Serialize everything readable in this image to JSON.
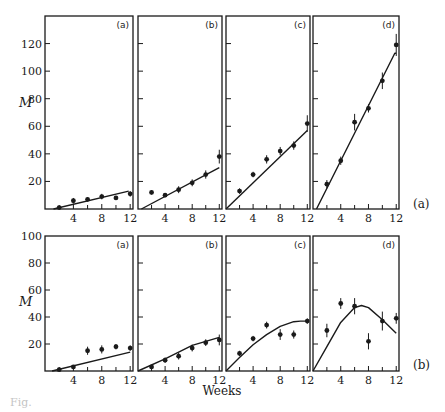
{
  "figure": {
    "xlabel": "Weeks",
    "ylabel": "M",
    "caption": "Fig."
  },
  "chart_data": [
    {
      "type": "scatter",
      "row": "(a)",
      "panel": "(a)",
      "xlabel": "Weeks",
      "ylabel": "M",
      "xlim": [
        0,
        12.4
      ],
      "ylim": [
        0,
        140
      ],
      "xticks": [
        4,
        8,
        12
      ],
      "yticks": [
        20,
        40,
        60,
        80,
        100,
        120
      ],
      "points": {
        "x": [
          2,
          4,
          6,
          8,
          10,
          12
        ],
        "y": [
          1,
          6,
          7,
          9,
          8,
          11
        ],
        "err": [
          1,
          2,
          1.5,
          2,
          1.5,
          2
        ]
      },
      "fit_line": {
        "x": [
          1.2,
          11.8
        ],
        "y": [
          0,
          13
        ]
      }
    },
    {
      "type": "scatter",
      "row": "(a)",
      "panel": "(b)",
      "xlim": [
        0,
        12.4
      ],
      "ylim": [
        0,
        140
      ],
      "xticks": [
        4,
        8,
        12
      ],
      "points": {
        "x": [
          2,
          4,
          6,
          8,
          10,
          12
        ],
        "y": [
          12,
          10,
          14,
          19,
          25,
          38
        ],
        "err": [
          1.5,
          1.5,
          2.5,
          2.5,
          3,
          5
        ]
      },
      "fit_line": {
        "x": [
          0.5,
          12
        ],
        "y": [
          0,
          30
        ]
      }
    },
    {
      "type": "scatter",
      "row": "(a)",
      "panel": "(c)",
      "xlim": [
        0,
        12.4
      ],
      "ylim": [
        0,
        140
      ],
      "xticks": [
        4,
        8,
        12
      ],
      "points": {
        "x": [
          2,
          4,
          6,
          8,
          10,
          12
        ],
        "y": [
          13,
          25,
          36,
          42,
          46,
          62
        ],
        "err": [
          2,
          2,
          3,
          3,
          3,
          6
        ]
      },
      "fit_line": {
        "x": [
          0,
          12
        ],
        "y": [
          0,
          57
        ]
      }
    },
    {
      "type": "scatter",
      "row": "(a)",
      "panel": "(d)",
      "xlim": [
        0,
        12.4
      ],
      "ylim": [
        0,
        140
      ],
      "xticks": [
        4,
        8,
        12
      ],
      "points": {
        "x": [
          2,
          4,
          6,
          8,
          10,
          12
        ],
        "y": [
          18,
          35,
          63,
          73,
          93,
          119
        ],
        "err": [
          3,
          3,
          6,
          3,
          6,
          8
        ]
      },
      "fit_line": {
        "x": [
          0.5,
          11.8,
          12
        ],
        "y": [
          0,
          113,
          113
        ]
      }
    },
    {
      "type": "scatter",
      "row": "(b)",
      "panel": "(a)",
      "xlabel": "Weeks",
      "ylabel": "M",
      "xlim": [
        0,
        12.4
      ],
      "ylim": [
        0,
        100
      ],
      "xticks": [
        4,
        8,
        12
      ],
      "yticks": [
        20,
        40,
        60,
        80,
        100
      ],
      "points": {
        "x": [
          2,
          4,
          6,
          8,
          10,
          12
        ],
        "y": [
          1,
          3,
          15,
          16,
          18,
          17
        ],
        "err": [
          1,
          1,
          3,
          3,
          2,
          2
        ]
      },
      "fit_line": {
        "x": [
          1,
          12
        ],
        "y": [
          0,
          14
        ]
      }
    },
    {
      "type": "scatter",
      "row": "(b)",
      "panel": "(b)",
      "xlim": [
        0,
        12.4
      ],
      "ylim": [
        0,
        100
      ],
      "xticks": [
        4,
        8,
        12
      ],
      "points": {
        "x": [
          2,
          4,
          6,
          8,
          10,
          12
        ],
        "y": [
          3,
          8,
          11,
          17,
          21,
          23
        ],
        "err": [
          1.5,
          2,
          2.5,
          2.5,
          2.5,
          4
        ]
      },
      "fit_line": {
        "x": [
          0,
          4,
          8,
          12
        ],
        "y": [
          0,
          9,
          19,
          25
        ]
      }
    },
    {
      "type": "scatter",
      "row": "(b)",
      "panel": "(c)",
      "xlim": [
        0,
        12.4
      ],
      "ylim": [
        0,
        100
      ],
      "xticks": [
        4,
        8,
        12
      ],
      "points": {
        "x": [
          2,
          4,
          6,
          8,
          10,
          12
        ],
        "y": [
          13,
          24,
          34,
          27,
          27,
          37
        ],
        "err": [
          2,
          2,
          2.5,
          4,
          3,
          2
        ]
      },
      "fit_line": {
        "x": [
          0,
          2,
          4,
          6,
          8,
          10,
          11,
          12
        ],
        "y": [
          0,
          10,
          19.5,
          27,
          33,
          36.5,
          37,
          37
        ]
      }
    },
    {
      "type": "scatter",
      "row": "(b)",
      "panel": "(d)",
      "xlim": [
        0,
        12.4
      ],
      "ylim": [
        0,
        100
      ],
      "xticks": [
        4,
        8,
        12
      ],
      "points": {
        "x": [
          2,
          4,
          6,
          8,
          10,
          12
        ],
        "y": [
          30,
          50,
          48,
          22,
          37,
          39
        ],
        "err": [
          5,
          4,
          6,
          6,
          7,
          4
        ]
      },
      "fit_line": {
        "x": [
          0,
          2,
          4,
          6,
          7,
          8,
          10,
          12
        ],
        "y": [
          0,
          18,
          36,
          47,
          48.5,
          47,
          38,
          28
        ]
      }
    }
  ],
  "row_labels": [
    "(a)",
    "(b)"
  ]
}
